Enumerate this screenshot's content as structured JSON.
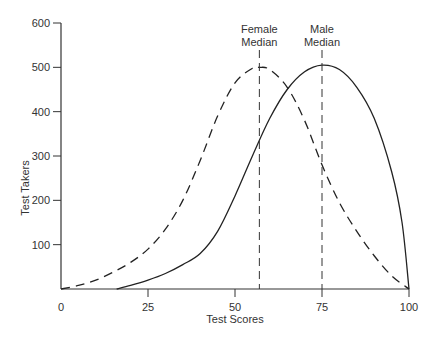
{
  "chart_data": {
    "type": "line",
    "title": "",
    "xlabel": "Test Scores",
    "ylabel": "Test Takers",
    "xlim": [
      0,
      100
    ],
    "ylim": [
      0,
      600
    ],
    "x_ticks": [
      "0",
      "25",
      "50",
      "75",
      "100"
    ],
    "y_ticks": [
      "100",
      "200",
      "300",
      "400",
      "500",
      "600"
    ],
    "grid": false,
    "legend": null,
    "series": [
      {
        "name": "Female",
        "style": "dashed",
        "x": [
          0,
          5,
          10,
          15,
          20,
          25,
          30,
          35,
          40,
          45,
          50,
          55,
          57,
          60,
          65,
          70,
          75,
          80,
          85,
          90,
          95,
          100
        ],
        "values": [
          0,
          8,
          20,
          38,
          60,
          90,
          135,
          200,
          290,
          390,
          465,
          498,
          500,
          495,
          455,
          380,
          280,
          195,
          130,
          75,
          30,
          0
        ]
      },
      {
        "name": "Male",
        "style": "solid",
        "x": [
          16,
          20,
          25,
          30,
          35,
          40,
          45,
          50,
          55,
          60,
          65,
          70,
          75,
          80,
          85,
          90,
          95,
          98,
          100
        ],
        "values": [
          0,
          8,
          20,
          35,
          55,
          80,
          130,
          210,
          300,
          385,
          450,
          490,
          505,
          495,
          455,
          385,
          265,
          150,
          0
        ]
      }
    ],
    "annotations": [
      {
        "label_line1": "Female",
        "label_line2": "Median",
        "x": 57,
        "style": "dashed-vertical"
      },
      {
        "label_line1": "Male",
        "label_line2": "Median",
        "x": 75,
        "style": "dashed-vertical"
      }
    ]
  }
}
